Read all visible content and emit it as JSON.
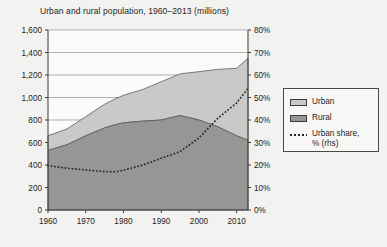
{
  "chart_data": {
    "type": "area",
    "title": "Urban and rural population, 1960–2013 (millions)",
    "xlabel": "",
    "ylabel": "",
    "y2label": "",
    "grid": true,
    "legend_position": "right",
    "xlim": [
      1960,
      2013
    ],
    "ylim": [
      0,
      1600
    ],
    "y2lim": [
      0,
      80
    ],
    "xticks": [
      "1960",
      "1970",
      "1980",
      "1990",
      "2000",
      "2010"
    ],
    "xtick_values": [
      1960,
      1970,
      1980,
      1990,
      2000,
      2010
    ],
    "yticks": [
      "0",
      "200",
      "400",
      "600",
      "800",
      "1,000",
      "1,200",
      "1,400",
      "1,600"
    ],
    "ytick_values": [
      0,
      200,
      400,
      600,
      800,
      1000,
      1200,
      1400,
      1600
    ],
    "y2ticks": [
      "0%",
      "10%",
      "20%",
      "30%",
      "40%",
      "50%",
      "60%",
      "70%",
      "80%"
    ],
    "y2tick_values": [
      0,
      10,
      20,
      30,
      40,
      50,
      60,
      70,
      80
    ],
    "x": [
      1960,
      1965,
      1970,
      1975,
      1978,
      1980,
      1985,
      1990,
      1995,
      2000,
      2005,
      2010,
      2013
    ],
    "series": [
      {
        "name": "Rural",
        "axis": "left",
        "stacked": true,
        "order": 0,
        "color": "#969694",
        "values": [
          530,
          580,
          660,
          730,
          760,
          775,
          790,
          800,
          840,
          800,
          740,
          660,
          620
        ]
      },
      {
        "name": "Urban",
        "axis": "left",
        "stacked": true,
        "order": 1,
        "color": "#c9c9c7",
        "values": [
          130,
          140,
          170,
          210,
          230,
          245,
          280,
          340,
          370,
          430,
          510,
          600,
          730
        ]
      },
      {
        "name": "Urban share, % (rhs)",
        "axis": "right",
        "stacked": false,
        "style": "dotted",
        "color": "#2a2a2a",
        "values": [
          19.7,
          18.6,
          17.8,
          17.1,
          17.0,
          17.7,
          19.9,
          23.0,
          26.0,
          32.0,
          40.8,
          47.6,
          54.0
        ]
      }
    ],
    "totals": [
      660,
      720,
      830,
      940,
      990,
      1020,
      1070,
      1140,
      1210,
      1230,
      1250,
      1260,
      1350
    ]
  },
  "legend": {
    "items": [
      {
        "label": "Urban",
        "marker": "swatch-light"
      },
      {
        "label": "Rural",
        "marker": "swatch-dark"
      },
      {
        "label": "Urban share,\n% (rhs)",
        "marker": "dotted-line"
      }
    ]
  }
}
